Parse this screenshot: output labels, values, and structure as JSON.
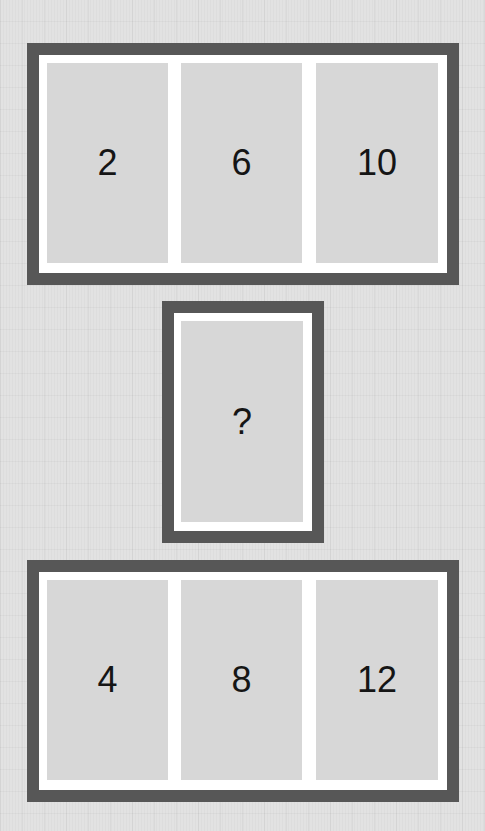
{
  "puzzle": {
    "top_row": {
      "cells": [
        {
          "value": "2"
        },
        {
          "value": "6"
        },
        {
          "value": "10"
        }
      ]
    },
    "middle": {
      "cell": {
        "value": "?"
      }
    },
    "bottom_row": {
      "cells": [
        {
          "value": "4"
        },
        {
          "value": "8"
        },
        {
          "value": "12"
        }
      ]
    }
  },
  "colors": {
    "background": "#e2e2e2",
    "frame_border": "#575757",
    "frame_fill": "#ffffff",
    "cell_fill": "#d7d7d7",
    "text": "#151515"
  }
}
